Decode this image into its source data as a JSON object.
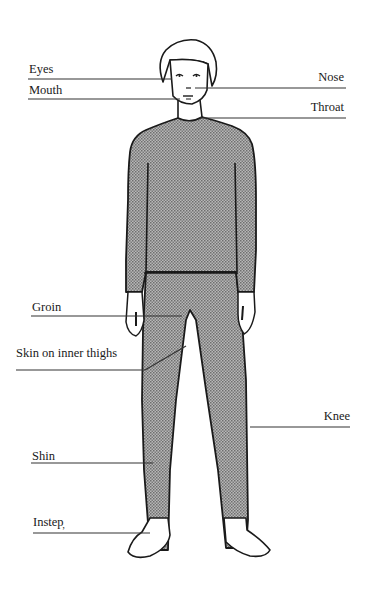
{
  "diagram": {
    "type": "anatomical body diagram (front view, clothed figure)",
    "colors": {
      "outline": "#1a1a1a",
      "clothing_fill": "#9a9a9a",
      "skin_fill": "#ffffff",
      "background": "#ffffff"
    },
    "labels": [
      {
        "id": "eyes",
        "text": "Eyes",
        "side": "left"
      },
      {
        "id": "mouth",
        "text": "Mouth",
        "side": "left"
      },
      {
        "id": "nose",
        "text": "Nose",
        "side": "right"
      },
      {
        "id": "throat",
        "text": "Throat",
        "side": "right"
      },
      {
        "id": "groin",
        "text": "Groin",
        "side": "left"
      },
      {
        "id": "inner_thighs",
        "text": "Skin on inner thighs",
        "side": "left"
      },
      {
        "id": "knee",
        "text": "Knee",
        "side": "right"
      },
      {
        "id": "shin",
        "text": "Shin",
        "side": "left"
      },
      {
        "id": "instep",
        "text": "Instep̦",
        "side": "left"
      }
    ]
  }
}
